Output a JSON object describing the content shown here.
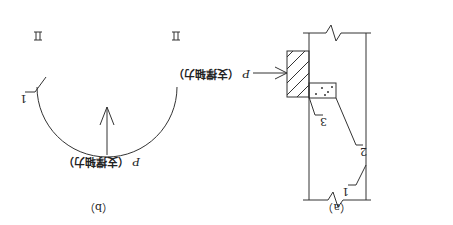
{
  "diagrams": {
    "a": {
      "caption": "（a）",
      "force_symbol": "P",
      "force_label": "（支撑轴力）",
      "callouts": [
        "1",
        "2",
        "3"
      ]
    },
    "b": {
      "caption": "（b）",
      "force_symbol": "P",
      "force_label": "（支撑轴力）",
      "callouts": [
        "1"
      ]
    }
  },
  "colors": {
    "stroke": "#333333",
    "hatch": "#444444",
    "background": "#ffffff"
  },
  "orientation": "rotated-180"
}
